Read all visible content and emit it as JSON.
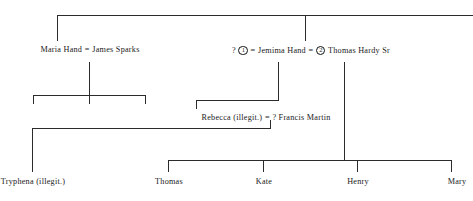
{
  "diagram": {
    "title_cut_off": "",
    "line_color": "#2b2b2b",
    "text_color": "#1a1a1a",
    "background": "#ffffff",
    "generation_1": {
      "left_union": {
        "left_label": "Maria Hand",
        "equals": "=",
        "right_label": "James Sparks"
      },
      "right_union": {
        "prefix_unknown": "?",
        "marriage_1": "1",
        "equals_1": "=",
        "center_label": "Jemima Hand",
        "equals_2": "=",
        "marriage_2": "2",
        "right_label": "Thomas Hardy Sr"
      }
    },
    "generation_2": {
      "union": {
        "left_label": "Rebecca (illegit.)",
        "equals": "=",
        "right_label": "? Francis Martin"
      }
    },
    "generation_3": {
      "children": [
        {
          "label": "Tryphena (illegit.)"
        },
        {
          "label": "Thomas"
        },
        {
          "label": "Kate"
        },
        {
          "label": "Henry"
        },
        {
          "label": "Mary"
        }
      ]
    }
  }
}
